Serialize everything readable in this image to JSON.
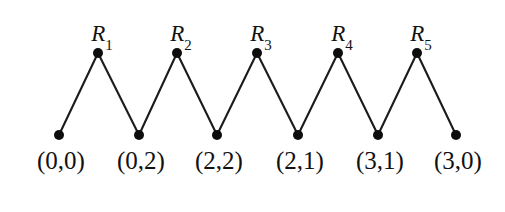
{
  "figure": {
    "background_color": "#ffffff",
    "node_color": "#0d0d0d",
    "edge_color": "#1b1b1b",
    "text_color": "#111111",
    "width": 505,
    "height": 212
  },
  "chart_data": {
    "type": "diagram",
    "subtype": "node-link-zigzag-graph",
    "title": "",
    "xlabel": "",
    "ylabel": "",
    "grid": false,
    "legend": null,
    "top_nodes": [
      {
        "label": "R",
        "subscript": "1",
        "x": 98,
        "y": 53
      },
      {
        "label": "R",
        "subscript": "2",
        "x": 177,
        "y": 53
      },
      {
        "label": "R",
        "subscript": "3",
        "x": 257,
        "y": 53
      },
      {
        "label": "R",
        "subscript": "4",
        "x": 338,
        "y": 53
      },
      {
        "label": "R",
        "subscript": "5",
        "x": 417,
        "y": 53
      }
    ],
    "bottom_nodes": [
      {
        "label": "(0,0)",
        "x": 59,
        "y": 135
      },
      {
        "label": "(0,2)",
        "x": 139,
        "y": 135
      },
      {
        "label": "(2,2)",
        "x": 217,
        "y": 135
      },
      {
        "label": "(2,1)",
        "x": 298,
        "y": 135
      },
      {
        "label": "(3,1)",
        "x": 378,
        "y": 135
      },
      {
        "label": "(3,0)",
        "x": 456,
        "y": 135
      }
    ],
    "edges": [
      {
        "from": "(0,0)",
        "to": "R1"
      },
      {
        "from": "R1",
        "to": "(0,2)"
      },
      {
        "from": "(0,2)",
        "to": "R2"
      },
      {
        "from": "R2",
        "to": "(2,2)"
      },
      {
        "from": "(2,2)",
        "to": "R3"
      },
      {
        "from": "R3",
        "to": "(2,1)"
      },
      {
        "from": "(2,1)",
        "to": "R4"
      },
      {
        "from": "R4",
        "to": "(3,1)"
      },
      {
        "from": "(3,1)",
        "to": "R5"
      },
      {
        "from": "R5",
        "to": "(3,0)"
      }
    ],
    "node_radius": 5,
    "edge_width": 2.1
  }
}
